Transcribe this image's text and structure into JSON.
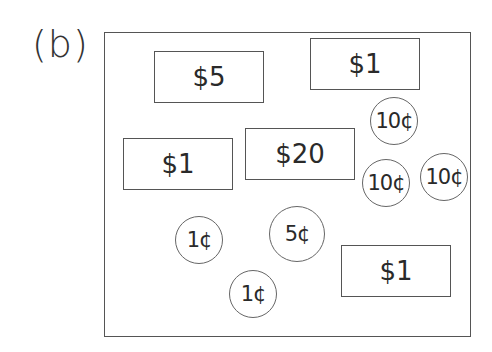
{
  "figure": {
    "label": "(b)",
    "bills": [
      {
        "value": "$5",
        "x": 154,
        "y": 51
      },
      {
        "value": "$1",
        "x": 310,
        "y": 38
      },
      {
        "value": "$1",
        "x": 123,
        "y": 138
      },
      {
        "value": "$20",
        "x": 245,
        "y": 128
      },
      {
        "value": "$1",
        "x": 341,
        "y": 245
      }
    ],
    "coins": [
      {
        "value": "10¢",
        "cx": 394,
        "cy": 121,
        "r": 24
      },
      {
        "value": "10¢",
        "cx": 386,
        "cy": 183,
        "r": 24
      },
      {
        "value": "10¢",
        "cx": 444,
        "cy": 177,
        "r": 24
      },
      {
        "value": "1¢",
        "cx": 199,
        "cy": 240,
        "r": 24
      },
      {
        "value": "5¢",
        "cx": 297,
        "cy": 234,
        "r": 28
      },
      {
        "value": "1¢",
        "cx": 253,
        "cy": 294,
        "r": 24
      }
    ]
  }
}
